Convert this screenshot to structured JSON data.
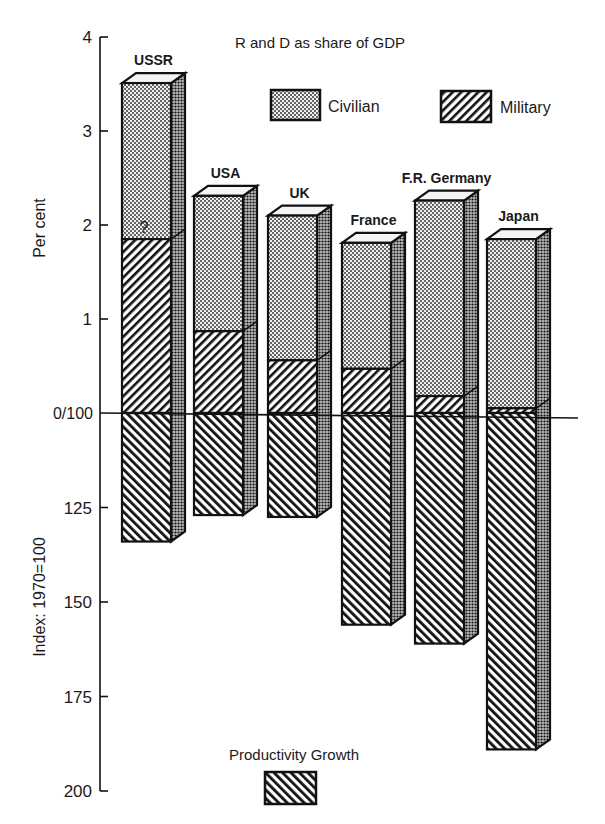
{
  "chart_data": {
    "type": "bar",
    "subtype": "3d-stacked-diverging",
    "title": "R and D as share of GDP",
    "categories": [
      "USSR",
      "USA",
      "UK",
      "France",
      "F.R. Germany",
      "Japan"
    ],
    "upper_panel": {
      "ylabel": "Per cent",
      "ylim": [
        0,
        4
      ],
      "ticks": [
        "0/100",
        "1",
        "2",
        "3",
        "4"
      ],
      "series": [
        {
          "name": "Military",
          "pattern": "diagonal-hatch",
          "values": [
            1.85,
            0.87,
            0.56,
            0.47,
            0.18,
            0.05
          ]
        },
        {
          "name": "Civilian",
          "pattern": "dots",
          "values": [
            1.66,
            1.44,
            1.54,
            1.34,
            2.08,
            1.8
          ]
        }
      ],
      "totals": [
        3.51,
        2.31,
        2.1,
        1.81,
        2.26,
        1.85
      ],
      "annotations": [
        {
          "category": "USSR",
          "text": "?",
          "position": "civilian segment, just above military boundary"
        }
      ]
    },
    "lower_panel": {
      "ylabel": "Index: 1970=100",
      "ylim": [
        100,
        200
      ],
      "inverted": true,
      "ticks": [
        "0/100",
        "125",
        "150",
        "175",
        "200"
      ],
      "series": [
        {
          "name": "Productivity Growth",
          "pattern": "back-diagonal-hatch",
          "values": [
            134,
            127,
            127.5,
            156,
            161,
            189
          ]
        }
      ]
    },
    "legend": {
      "civilian": "Civilian",
      "military": "Military",
      "productivity": "Productivity Growth",
      "position": "upper: top-right; lower: bottom-center"
    },
    "grid": false
  },
  "labels": {
    "title": "R and D as share of GDP",
    "upper_axis_label": "Per cent",
    "lower_axis_label": "Index: 1970=100",
    "question_mark": "?",
    "upper_ticks": [
      {
        "label": "4",
        "value": 4
      },
      {
        "label": "3",
        "value": 3
      },
      {
        "label": "2",
        "value": 2
      },
      {
        "label": "1",
        "value": 1
      }
    ],
    "zero_label": "0/100",
    "lower_ticks": [
      {
        "label": "125",
        "value": 125
      },
      {
        "label": "150",
        "value": 150
      },
      {
        "label": "175",
        "value": 175
      },
      {
        "label": "200",
        "value": 200
      }
    ]
  },
  "colors": {
    "ink": "#111111",
    "background": "#ffffff",
    "dot_fill": "#e8e8e8"
  }
}
